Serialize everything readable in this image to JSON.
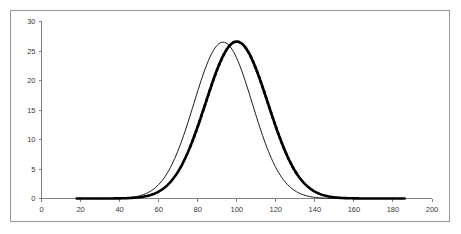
{
  "chart_data": {
    "type": "line",
    "title": "",
    "xlabel": "",
    "ylabel": "",
    "xlim": [
      0,
      200
    ],
    "ylim": [
      0,
      30
    ],
    "xticks": [
      0,
      20,
      40,
      60,
      80,
      100,
      120,
      140,
      160,
      180,
      200
    ],
    "yticks": [
      0,
      5,
      10,
      15,
      20,
      25,
      30
    ],
    "grid": false,
    "legend": "none",
    "series": [
      {
        "name": "thin-curve",
        "style": "solid-thin",
        "color": "#1a1a1a",
        "distribution": "normal",
        "mean": 93,
        "sigma": 15,
        "peak_value": 26.5,
        "x": [
          20,
          30,
          40,
          45,
          50,
          55,
          60,
          65,
          70,
          75,
          80,
          85,
          90,
          93,
          95,
          100,
          105,
          110,
          115,
          120,
          125,
          130,
          135,
          140,
          145,
          150,
          160,
          180,
          200
        ],
        "values": [
          0.0,
          0.0,
          0.1,
          0.3,
          0.7,
          1.6,
          3.1,
          5.3,
          8.5,
          12.3,
          16.6,
          20.9,
          24.5,
          26.5,
          26.2,
          24.4,
          21.1,
          17.1,
          13.0,
          9.2,
          6.1,
          3.8,
          2.2,
          1.2,
          0.6,
          0.3,
          0.1,
          0.0,
          0.0
        ]
      },
      {
        "name": "thick-curve",
        "style": "thick-with-dashed-flanks",
        "color": "#000000",
        "distribution": "normal",
        "mean": 100,
        "sigma": 16,
        "peak_value": 26.6,
        "x": [
          20,
          30,
          40,
          45,
          50,
          55,
          60,
          65,
          70,
          75,
          80,
          85,
          90,
          95,
          100,
          105,
          110,
          115,
          120,
          125,
          130,
          135,
          140,
          145,
          150,
          160,
          180,
          200
        ],
        "values": [
          0.0,
          0.0,
          0.0,
          0.1,
          0.3,
          0.7,
          1.5,
          2.9,
          5.1,
          8.2,
          11.9,
          16.0,
          20.1,
          23.8,
          26.6,
          25.9,
          23.4,
          19.7,
          15.4,
          11.2,
          7.6,
          4.8,
          2.8,
          1.5,
          0.8,
          0.2,
          0.0,
          0.0
        ]
      }
    ]
  }
}
